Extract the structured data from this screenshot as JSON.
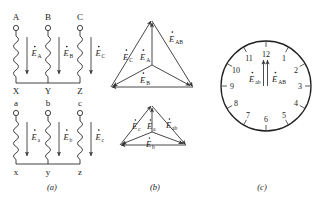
{
  "figure": {
    "background_color": "#ffffff",
    "line_color": "#2a2a2a",
    "panels": [
      {
        "id": "a",
        "caption": "(a)",
        "caption_x": 52,
        "caption_y": 182
      },
      {
        "id": "b",
        "caption": "(b)",
        "caption_x": 155,
        "caption_y": 182
      },
      {
        "id": "c",
        "caption": "(c)",
        "caption_x": 262,
        "caption_y": 182
      }
    ]
  },
  "panel_a": {
    "name": "winding-connection-diagram",
    "hv_winding": {
      "top_terminals": [
        "A",
        "B",
        "C"
      ],
      "bottom_terminals": [
        "X",
        "Y",
        "Z"
      ],
      "emf_labels": [
        {
          "base": "E",
          "sub": "A"
        },
        {
          "base": "E",
          "sub": "B"
        },
        {
          "base": "E",
          "sub": "C"
        }
      ]
    },
    "lv_winding": {
      "top_terminals": [
        "a",
        "b",
        "c"
      ],
      "bottom_terminals": [
        "x",
        "y",
        "z"
      ],
      "emf_labels": [
        {
          "base": "E",
          "sub": "a"
        },
        {
          "base": "E",
          "sub": "b"
        },
        {
          "base": "E",
          "sub": "c"
        }
      ]
    }
  },
  "panel_b": {
    "name": "phasor-triangle-diagram",
    "upper_triangle": {
      "label": "HV phasor triangle",
      "phasors": [
        {
          "base": "E",
          "sub": "C",
          "x": 122,
          "y": 60
        },
        {
          "base": "E",
          "sub": "A",
          "x": 143,
          "y": 60
        },
        {
          "base": "E",
          "sub": "AB",
          "x": 168,
          "y": 40
        },
        {
          "base": "E",
          "sub": "B",
          "x": 143,
          "y": 83
        }
      ]
    },
    "lower_triangle": {
      "label": "LV phasor triangle",
      "phasors": [
        {
          "base": "E",
          "sub": "c",
          "x": 131,
          "y": 129
        },
        {
          "base": "E",
          "sub": "a",
          "x": 147,
          "y": 129
        },
        {
          "base": "E",
          "sub": "ab",
          "x": 168,
          "y": 128
        },
        {
          "base": "E",
          "sub": "b",
          "x": 146,
          "y": 147
        }
      ]
    }
  },
  "panel_c": {
    "name": "clock-notation-diagram",
    "hour_numbers": [
      "1",
      "2",
      "3",
      "4",
      "5",
      "6",
      "7",
      "8",
      "9",
      "10",
      "11",
      "12"
    ],
    "hands": [
      {
        "base": "E",
        "sub": "ab",
        "position_hour": 12
      },
      {
        "base": "E",
        "sub": "AB",
        "position_hour": 12
      }
    ],
    "hand_labels": [
      {
        "base": "E",
        "sub": "ab",
        "x": 249,
        "y": 84
      },
      {
        "base": "E",
        "sub": "AB",
        "x": 272,
        "y": 84
      }
    ],
    "circle": {
      "cx": 266,
      "cy": 86,
      "r": 45
    }
  }
}
